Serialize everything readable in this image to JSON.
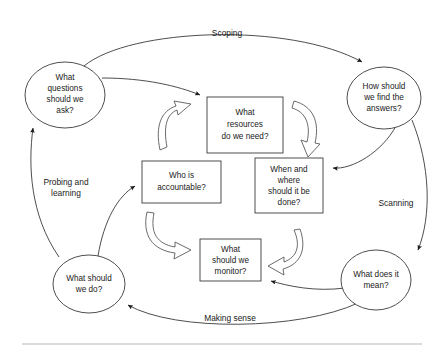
{
  "diagram": {
    "background_color": "#ffffff",
    "line_color": "#3a3a3a",
    "text_color": "#1a1a1a",
    "rule_color": "#b9b9b9",
    "outer_nodes": [
      {
        "id": "questions",
        "shape": "ellipse",
        "lines": [
          "What",
          "questions",
          "should we",
          "ask?"
        ],
        "cx": 65,
        "cy": 95,
        "rx": 40,
        "ry": 33
      },
      {
        "id": "find-answers",
        "shape": "ellipse",
        "lines": [
          "How should",
          "we find the",
          "answers?"
        ],
        "cx": 384,
        "cy": 98,
        "rx": 37,
        "ry": 31
      },
      {
        "id": "what-means",
        "shape": "ellipse",
        "lines": [
          "What does it",
          "mean?"
        ],
        "cx": 376,
        "cy": 280,
        "rx": 35,
        "ry": 30
      },
      {
        "id": "what-do",
        "shape": "ellipse",
        "lines": [
          "What should",
          "we do?"
        ],
        "cx": 89,
        "cy": 284,
        "rx": 36,
        "ry": 29
      }
    ],
    "inner_nodes": [
      {
        "id": "resources",
        "shape": "rect",
        "lines": [
          "What",
          "resources",
          "do we need?"
        ],
        "x": 207,
        "y": 97,
        "w": 76,
        "h": 56
      },
      {
        "id": "accountable",
        "shape": "rect",
        "lines": [
          "Who is",
          "accountable?"
        ],
        "x": 142,
        "y": 161,
        "w": 79,
        "h": 42
      },
      {
        "id": "when-where",
        "shape": "rect",
        "lines": [
          "When and",
          "where",
          "should it be",
          "done?"
        ],
        "x": 255,
        "y": 158,
        "w": 68,
        "h": 55
      },
      {
        "id": "monitor",
        "shape": "rect",
        "lines": [
          "What",
          "should we",
          "monitor?"
        ],
        "x": 200,
        "y": 239,
        "w": 61,
        "h": 42
      }
    ],
    "phase_labels": [
      {
        "id": "scoping",
        "lines": [
          "Scoping"
        ],
        "x": 227,
        "y": 34
      },
      {
        "id": "scanning",
        "lines": [
          "Scanning"
        ],
        "x": 396,
        "y": 204
      },
      {
        "id": "making-sense",
        "lines": [
          "Making sense"
        ],
        "x": 230,
        "y": 319
      },
      {
        "id": "probing-learning",
        "lines": [
          "Probing and",
          "learning"
        ],
        "x": 66,
        "y": 189
      }
    ]
  }
}
